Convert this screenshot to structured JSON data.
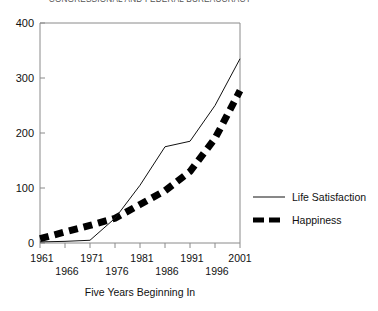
{
  "chart_data": {
    "type": "line",
    "title": "CONGRESSIONAL AND FEDERAL BUREAUCRACY",
    "xlabel": "Five Years Beginning In",
    "ylabel": "",
    "categories": [
      "1961",
      "1966",
      "1971",
      "1976",
      "1981",
      "1986",
      "1991",
      "1996",
      "2001"
    ],
    "yticks": [
      "0",
      "100",
      "200",
      "300",
      "400"
    ],
    "ylim": [
      0,
      400
    ],
    "grid": false,
    "legend_position": "right",
    "series": [
      {
        "name": "Life Satisfaction",
        "style": "solid-thin",
        "values": [
          2,
          3,
          5,
          45,
          105,
          175,
          185,
          250,
          335
        ]
      },
      {
        "name": "Happiness",
        "style": "dashed-thick",
        "values": [
          8,
          20,
          32,
          45,
          70,
          95,
          130,
          190,
          277
        ]
      }
    ]
  },
  "axis": {
    "y_tick_0": "0",
    "y_tick_1": "100",
    "y_tick_2": "200",
    "y_tick_3": "300",
    "y_tick_4": "400",
    "x_label_0": "1961",
    "x_label_1": "1966",
    "x_label_2": "1971",
    "x_label_3": "1976",
    "x_label_4": "1981",
    "x_label_5": "1986",
    "x_label_6": "1991",
    "x_label_7": "1996",
    "x_label_8": "2001",
    "x_axis_title": "Five Years Beginning In"
  },
  "legend": {
    "entry_0_label": "Life Satisfaction",
    "entry_1_label": "Happiness"
  },
  "colors": {
    "series_life_satisfaction": "#111111",
    "series_happiness": "#000000",
    "axis": "#8a8a8a",
    "background": "#ffffff"
  }
}
